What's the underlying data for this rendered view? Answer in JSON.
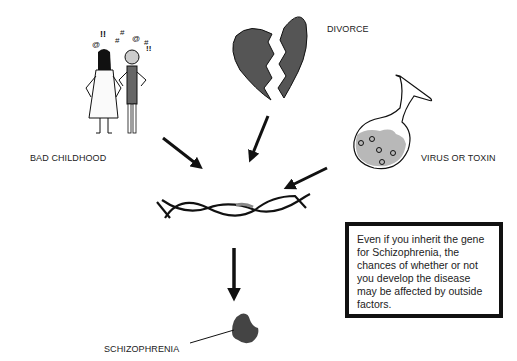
{
  "labels": {
    "bad_childhood": "BAD CHILDHOOD",
    "divorce": "DIVORCE",
    "virus_or_toxin": "VIRUS OR TOXIN",
    "schizophrenia": "SCHIZOPHRENIA"
  },
  "note": {
    "text": "Even if you inherit the gene for Schizophrenia, the chances of whether or not you develop the disease may be affected by outside factors."
  },
  "symbols": {
    "argument": [
      "@",
      "!!",
      "#",
      "#",
      "@",
      "#",
      "!!"
    ]
  },
  "colors": {
    "stroke": "#111111",
    "heart_fill": "#555555",
    "liquid_fill": "#b8b8b8",
    "gene_highlight": "#888888",
    "brain_fill": "#444444"
  }
}
